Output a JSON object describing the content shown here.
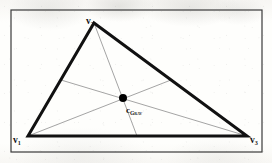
{
  "figure": {
    "kind": "geometry-diagram",
    "frame": {
      "x": 11,
      "y": 10,
      "width": 251,
      "height": 142
    },
    "colors": {
      "paper": "#fdfdfb",
      "frame_stroke": "#3a3a3a",
      "triangle_stroke": "#111111",
      "median_stroke": "#9a9a9a",
      "centroid_fill": "#000000",
      "label_text": "#141414"
    },
    "strokes": {
      "frame_width": 1.2,
      "triangle_width": 3.0,
      "median_width": 0.9
    },
    "vertices": [
      {
        "id": "v1",
        "label_base": "v",
        "label_sub": "1",
        "x": 28,
        "y": 136
      },
      {
        "id": "v2",
        "label_base": "v",
        "label_sub": "2",
        "x": 94,
        "y": 23
      },
      {
        "id": "v3",
        "label_base": "v",
        "label_sub": "3",
        "x": 247,
        "y": 136
      }
    ],
    "edge_midpoints": [
      {
        "id": "m12",
        "edge": "v1-v2",
        "x": 61,
        "y": 80
      },
      {
        "id": "m23",
        "edge": "v2-v3",
        "x": 171,
        "y": 80
      },
      {
        "id": "m13",
        "edge": "v1-v3",
        "x": 137,
        "y": 136
      }
    ],
    "medians": [
      {
        "id": "median-v1",
        "from": "v1",
        "to": "m23"
      },
      {
        "id": "median-v2",
        "from": "v2",
        "to": "m13"
      },
      {
        "id": "median-v3",
        "from": "v3",
        "to": "m12"
      }
    ],
    "centroid": {
      "x": 123,
      "y": 98,
      "radius": 4.0,
      "label_base": "c",
      "label_sub": "Grav"
    }
  }
}
